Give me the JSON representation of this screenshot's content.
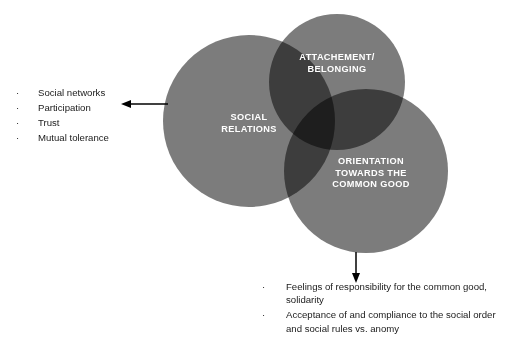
{
  "diagram": {
    "type": "venn-3-circle",
    "title": "",
    "circles": [
      {
        "id": "social-relations",
        "label": "SOCIAL\nRELATIONS",
        "label_lines": [
          "SOCIAL",
          "RELATIONS"
        ],
        "cx": 249,
        "cy": 121,
        "r": 86,
        "fill": "#7c7c7c"
      },
      {
        "id": "attachment-belonging",
        "label": "ATTACHEMENT/\nBELONGING",
        "label_lines": [
          "ATTACHEMENT/",
          "BELONGING"
        ],
        "cx": 337,
        "cy": 82,
        "r": 68,
        "fill": "#7c7c7c"
      },
      {
        "id": "orientation-common-good",
        "label": "ORIENTATION\nTOWARDS THE\nCOMMON GOOD",
        "label_lines": [
          "ORIENTATION",
          "TOWARDS THE",
          "COMMON GOOD"
        ],
        "cx": 366,
        "cy": 171,
        "r": 82,
        "fill": "#7c7c7c"
      }
    ],
    "colors": {
      "circle_fill": "#7c7c7c",
      "pair_overlap": "#3c3c3c",
      "triple_overlap": "#1a1a1a",
      "label_text": "#ffffff",
      "body_text": "#1a1a1a",
      "background": "#ffffff",
      "arrow": "#000000"
    }
  },
  "left_annotation": {
    "bullet_char": "·",
    "items": [
      "Social networks",
      "Participation",
      "Trust",
      "Mutual tolerance"
    ],
    "arrow": {
      "name": "arrow-left",
      "direction": "left",
      "points_to": "social-relations"
    }
  },
  "bottom_annotation": {
    "bullet_char": "·",
    "items": [
      "Feelings of responsibility for the common good, solidarity",
      "Acceptance of and compliance to the social order and social rules vs. anomy"
    ],
    "arrow": {
      "name": "arrow-down",
      "direction": "down",
      "points_from": "orientation-common-good"
    }
  }
}
